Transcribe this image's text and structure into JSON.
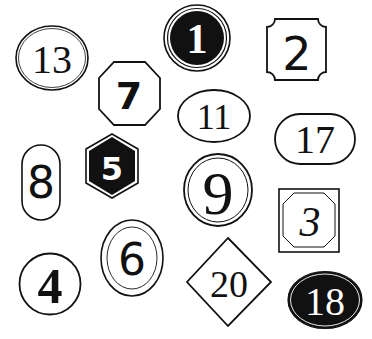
{
  "colors": {
    "ink": "#111111",
    "paper": "#ffffff"
  },
  "badges": [
    {
      "number": "13",
      "shape": "ellipse-double-outline",
      "fill": "white"
    },
    {
      "number": "1",
      "shape": "circle-double-ring",
      "fill": "black"
    },
    {
      "number": "2",
      "shape": "scalloped-square",
      "fill": "white"
    },
    {
      "number": "7",
      "shape": "octagon",
      "fill": "white"
    },
    {
      "number": "11",
      "shape": "ellipse",
      "fill": "white"
    },
    {
      "number": "17",
      "shape": "pill-horizontal",
      "fill": "white"
    },
    {
      "number": "8",
      "shape": "pill-vertical",
      "fill": "white"
    },
    {
      "number": "5",
      "shape": "hexagon",
      "fill": "black"
    },
    {
      "number": "9",
      "shape": "circle-double-outline",
      "fill": "white"
    },
    {
      "number": "3",
      "shape": "square-with-inner-octagon",
      "fill": "white"
    },
    {
      "number": "6",
      "shape": "ellipse-double-outline",
      "fill": "white"
    },
    {
      "number": "4",
      "shape": "circle",
      "fill": "white"
    },
    {
      "number": "20",
      "shape": "diamond",
      "fill": "white"
    },
    {
      "number": "18",
      "shape": "ellipse-inner-ring",
      "fill": "black"
    }
  ]
}
